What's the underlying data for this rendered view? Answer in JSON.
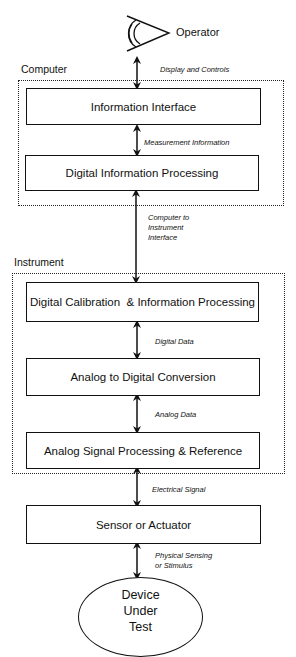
{
  "operator": {
    "label": "Operator",
    "icon": "eye-icon"
  },
  "groups": {
    "computer": "Computer",
    "instrument": "Instrument"
  },
  "blocks": {
    "information_interface": "Information Interface",
    "digital_information_processing": "Digital Information Processing",
    "digital_calibration": "Digital Calibration  & Information Processing",
    "adc": "Analog to Digital Conversion",
    "analog_signal_processing": "Analog Signal Processing & Reference",
    "sensor_actuator": "Sensor or Actuator"
  },
  "dut": {
    "line1": "Device",
    "line2": "Under",
    "line3": "Test"
  },
  "connections": {
    "display_controls": "Display and Controls",
    "measurement_information": "Measurement Information",
    "computer_to_instrument": {
      "line1": "Computer to",
      "line2": "Instrument",
      "line3": "Interface"
    },
    "digital_data": "Digital Data",
    "analog_data": "Analog Data",
    "electrical_signal": "Electrical Signal",
    "physical_sensing": {
      "line1": "Physical Sensing",
      "line2": "or Stimulus"
    }
  }
}
